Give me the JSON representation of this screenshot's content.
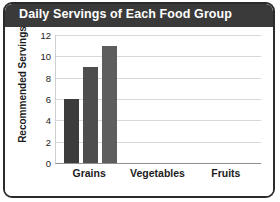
{
  "chart_data": {
    "type": "bar",
    "title": "Daily Servings of Each Food Group",
    "xlabel": "",
    "ylabel": "Recommended Servings",
    "categories": [
      "Grains",
      "Vegetables",
      "Fruits"
    ],
    "ylim": [
      0,
      12
    ],
    "yticks": [
      0,
      2,
      4,
      6,
      8,
      10,
      12
    ],
    "ytick_labels": [
      "0",
      "2",
      "4",
      "6",
      "8",
      "10",
      "12"
    ],
    "grid": true,
    "legend": false,
    "series": [
      {
        "name": "bar-1",
        "color": "#3c3c3c",
        "values": [
          6,
          null,
          null
        ]
      },
      {
        "name": "bar-2",
        "color": "#4e4e4e",
        "values": [
          9,
          null,
          null
        ]
      },
      {
        "name": "bar-3",
        "color": "#5e5e5e",
        "values": [
          11,
          null,
          null
        ]
      }
    ],
    "bars": [
      {
        "name": "grains-bar-1",
        "value": 6,
        "color": "#3c3c3c"
      },
      {
        "name": "grains-bar-2",
        "value": 9,
        "color": "#4e4e4e"
      },
      {
        "name": "grains-bar-3",
        "value": 11,
        "color": "#5e5e5e"
      }
    ]
  },
  "colors": {
    "title_bar": "#3a3a3a",
    "title_text": "#ffffff",
    "frame": "#2b2b2b",
    "gridline": "#d8d8d8",
    "axis": "#8f8f8f",
    "plot_background": "#ffffff"
  }
}
